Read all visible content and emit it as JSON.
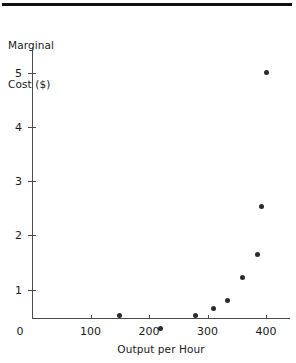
{
  "chart_data": {
    "type": "scatter",
    "title": "",
    "xlabel": "Output per Hour",
    "ylabel": "Marginal Cost ($)",
    "ylabel_lines": [
      "Marginal",
      "Cost ($)"
    ],
    "xlim": [
      0,
      440
    ],
    "ylim": [
      0,
      5.55
    ],
    "x_ticks": [
      0,
      100,
      200,
      300,
      400
    ],
    "x_ticklabels": [
      "0",
      "100",
      "200",
      "300",
      "400"
    ],
    "y_ticks": [
      1,
      2,
      3,
      4,
      5
    ],
    "y_ticklabels": [
      "1",
      "2",
      "3",
      "4",
      "5"
    ],
    "grid": false,
    "legend": false,
    "marker": "filled-circle",
    "marker_color": "#2b2b2b",
    "x": [
      150,
      220,
      280,
      310,
      335,
      360,
      385,
      392,
      400
    ],
    "y": [
      0.52,
      0.28,
      0.52,
      0.66,
      0.81,
      1.22,
      1.65,
      2.53,
      5.0
    ],
    "points": [
      {
        "x": 150,
        "y": 0.52
      },
      {
        "x": 220,
        "y": 0.28
      },
      {
        "x": 280,
        "y": 0.52
      },
      {
        "x": 310,
        "y": 0.66
      },
      {
        "x": 335,
        "y": 0.81
      },
      {
        "x": 360,
        "y": 1.22
      },
      {
        "x": 385,
        "y": 1.65
      },
      {
        "x": 392,
        "y": 2.53
      },
      {
        "x": 400,
        "y": 5.0
      }
    ]
  },
  "figure": {
    "axis_color": "#4a4a4a",
    "rule_color": "#111111",
    "background": "#ffffff"
  }
}
